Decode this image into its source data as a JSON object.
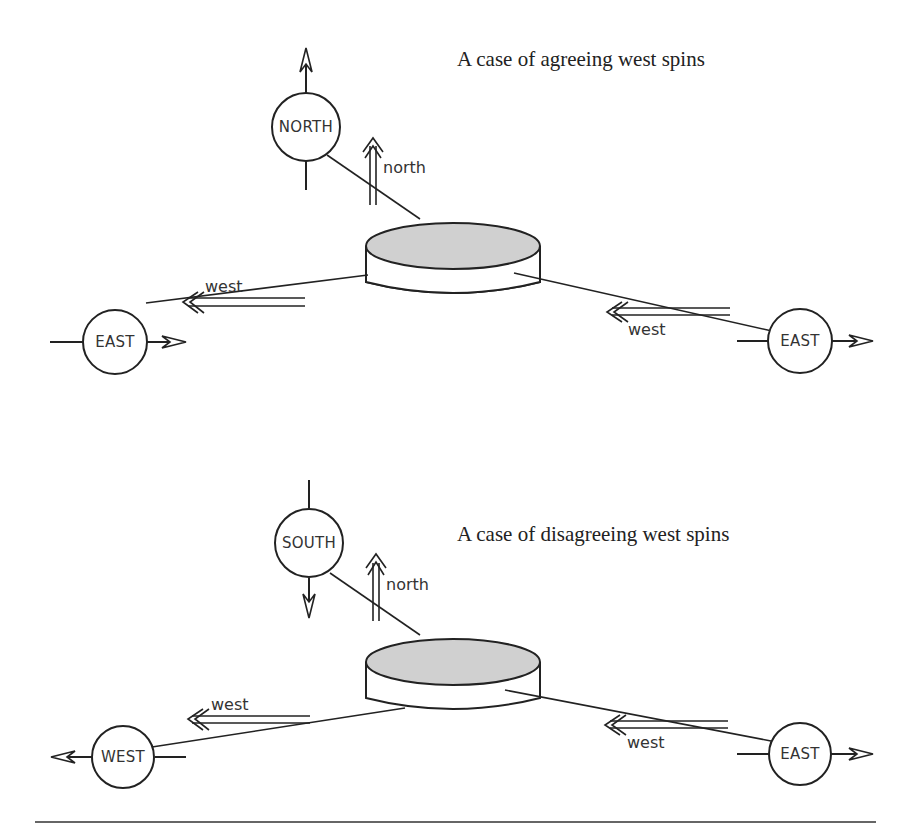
{
  "panels": [
    {
      "title": "A case of agreeing west spins",
      "top_detector": {
        "label": "NORTH",
        "arrow": "up"
      },
      "top_spin_label": "north",
      "left_detector": {
        "label": "EAST",
        "arrow": "right"
      },
      "left_spin_label": "west",
      "right_detector": {
        "label": "EAST",
        "arrow": "right"
      },
      "right_spin_label": "west"
    },
    {
      "title": "A case of disagreeing west spins",
      "top_detector": {
        "label": "SOUTH",
        "arrow": "down"
      },
      "top_spin_label": "north",
      "left_detector": {
        "label": "WEST",
        "arrow": "left"
      },
      "left_spin_label": "west",
      "right_detector": {
        "label": "EAST",
        "arrow": "right"
      },
      "right_spin_label": "west"
    }
  ],
  "colors": {
    "ink": "#222222",
    "disk_fill": "#d0d0d0",
    "background": "#ffffff"
  }
}
